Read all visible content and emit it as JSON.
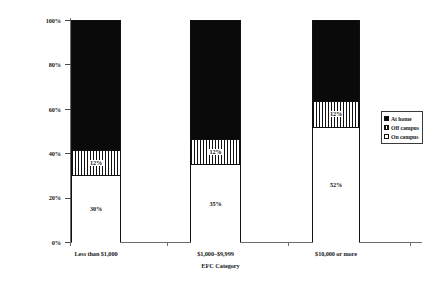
{
  "chart_data": {
    "type": "bar",
    "stacked": true,
    "title": "",
    "xlabel": "EFC Category",
    "ylabel": "",
    "ylim": [
      0,
      100
    ],
    "yticks": [
      "0%",
      "20%",
      "40%",
      "60%",
      "80%",
      "100%"
    ],
    "ytick_values": [
      0,
      20,
      40,
      60,
      80,
      100
    ],
    "grid": false,
    "legend_position": "right",
    "categories": [
      "Less than $1,000",
      "$1,000–$9,999",
      "$10,000 or more"
    ],
    "series": [
      {
        "name": "At home",
        "values": [
          58,
          53,
          36
        ],
        "labels": [
          "",
          "",
          ""
        ],
        "color": "#0a0a0a",
        "fill": "solid-black"
      },
      {
        "name": "Off campus",
        "values": [
          12,
          12,
          12
        ],
        "labels": [
          "12%",
          "12%",
          "12%"
        ],
        "color": "#111111",
        "fill": "vertical-hatch"
      },
      {
        "name": "On campus",
        "values": [
          30,
          35,
          52
        ],
        "labels": [
          "30%",
          "35%",
          "52%"
        ],
        "color": "#ffffff",
        "fill": "white"
      }
    ]
  },
  "axes": {
    "x_title": "EFC Category",
    "y_ticks": [
      {
        "label": "100%",
        "value": 100
      },
      {
        "label": "80%",
        "value": 80
      },
      {
        "label": "60%",
        "value": 60
      },
      {
        "label": "40%",
        "value": 40
      },
      {
        "label": "20%",
        "value": 20
      },
      {
        "label": "0%",
        "value": 0
      }
    ]
  },
  "categories": [
    {
      "label": "Less than $1,000"
    },
    {
      "label": "$1,000–$9,999"
    },
    {
      "label": "$10,000 or more"
    }
  ],
  "bars": [
    {
      "category": "Less than $1,000",
      "segments": [
        {
          "series": "At home",
          "value": 58,
          "label": ""
        },
        {
          "series": "Off campus",
          "value": 12,
          "label": "12%"
        },
        {
          "series": "On campus",
          "value": 30,
          "label": "30%"
        }
      ]
    },
    {
      "category": "$1,000–$9,999",
      "segments": [
        {
          "series": "At home",
          "value": 53,
          "label": ""
        },
        {
          "series": "Off campus",
          "value": 12,
          "label": "12%"
        },
        {
          "series": "On campus",
          "value": 35,
          "label": "35%"
        }
      ]
    },
    {
      "category": "$10,000 or more",
      "segments": [
        {
          "series": "At home",
          "value": 36,
          "label": ""
        },
        {
          "series": "Off campus",
          "value": 12,
          "label": "12%"
        },
        {
          "series": "On campus",
          "value": 52,
          "label": "52%"
        }
      ]
    }
  ],
  "legend": {
    "items": [
      {
        "label": "At home",
        "swatch": "solid-black"
      },
      {
        "label": "Off campus",
        "swatch": "vertical-hatch"
      },
      {
        "label": "On campus",
        "swatch": "white"
      }
    ]
  }
}
